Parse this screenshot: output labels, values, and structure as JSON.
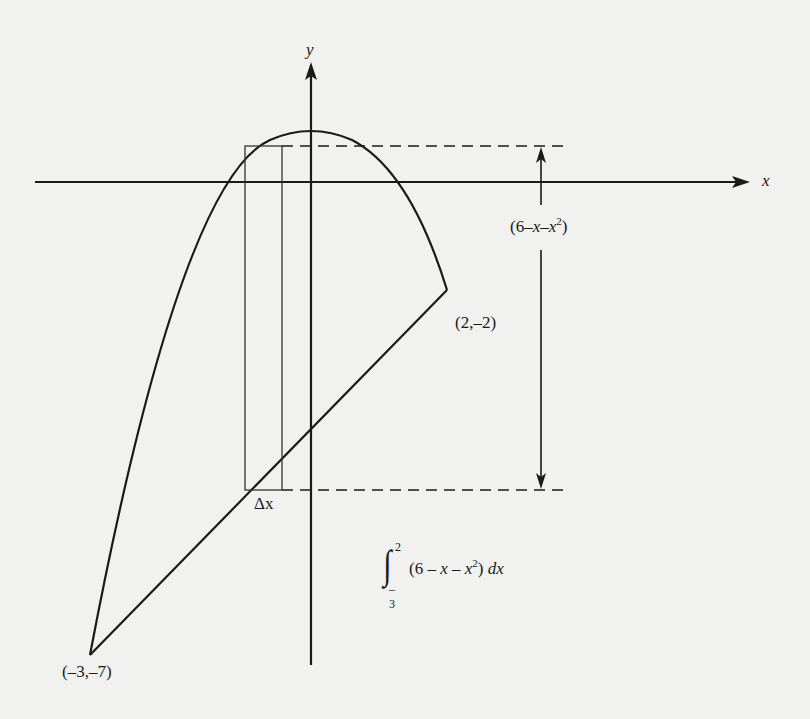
{
  "diagram": {
    "type": "area-between-curves",
    "axes": {
      "x_label": "x",
      "y_label": "y"
    },
    "curves": [
      {
        "name": "parabola",
        "equation": "y = 6 - x^2 (upper)",
        "shape": "downward parabola"
      },
      {
        "name": "line",
        "equation": "y = x - 4",
        "shape": "straight line"
      }
    ],
    "points": [
      {
        "label": "(2,–2)",
        "x": 2,
        "y": -2
      },
      {
        "label": "(–3,–7)",
        "x": -3,
        "y": -7
      }
    ],
    "strip": {
      "width_label": "Δx",
      "height_label_parts": [
        "(6–",
        "x",
        "–",
        "x",
        "2",
        ")"
      ]
    },
    "integral": {
      "upper": "2",
      "lower": "–3",
      "integrand_parts": [
        "(6 – ",
        "x",
        " – ",
        "x",
        "2",
        ") ",
        "dx"
      ]
    }
  },
  "colors": {
    "background": "#f1f1ef",
    "ink": "#1a1a1a"
  }
}
